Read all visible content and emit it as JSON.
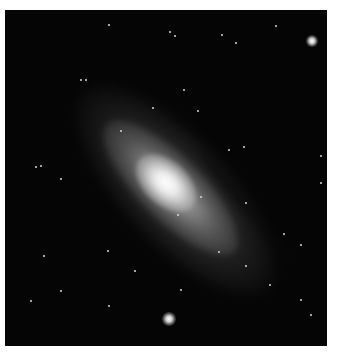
{
  "image": {
    "subject": "spiral galaxy",
    "background_color": "#050505",
    "border_color": "#ffffff",
    "core_color": "#ffffff"
  },
  "objects": {
    "galaxy_core": {
      "x": 165,
      "y": 182
    },
    "bright_star_bottom": {
      "x": 169,
      "y": 319,
      "size": 14
    },
    "bright_star_top_right": {
      "x": 312,
      "y": 41,
      "size": 12
    }
  },
  "stars": [
    [
      108,
      24
    ],
    [
      169,
      31
    ],
    [
      174,
      35
    ],
    [
      221,
      34
    ],
    [
      275,
      25
    ],
    [
      235,
      42
    ],
    [
      80,
      79
    ],
    [
      85,
      79
    ],
    [
      183,
      89
    ],
    [
      197,
      110
    ],
    [
      152,
      107
    ],
    [
      228,
      149
    ],
    [
      243,
      146
    ],
    [
      40,
      165
    ],
    [
      35,
      166
    ],
    [
      60,
      178
    ],
    [
      320,
      155
    ],
    [
      320,
      182
    ],
    [
      177,
      214
    ],
    [
      107,
      250
    ],
    [
      43,
      255
    ],
    [
      134,
      270
    ],
    [
      180,
      289
    ],
    [
      300,
      299
    ],
    [
      310,
      314
    ],
    [
      108,
      305
    ],
    [
      60,
      290
    ],
    [
      245,
      265
    ],
    [
      283,
      233
    ],
    [
      200,
      196
    ],
    [
      245,
      202
    ],
    [
      269,
      284
    ],
    [
      300,
      244
    ],
    [
      30,
      300
    ],
    [
      218,
      251
    ],
    [
      120,
      130
    ]
  ]
}
